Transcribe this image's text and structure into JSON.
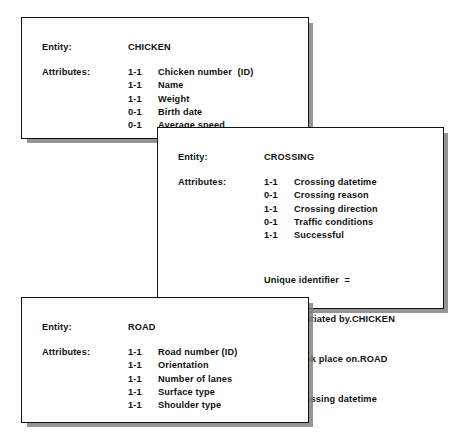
{
  "diagram": {
    "style": {
      "card_background": "#ffffff",
      "card_border": "#111111",
      "card_shadow": "#828282",
      "text_color": "#101010"
    },
    "labels": {
      "entity": "Entity:",
      "attributes": "Attributes:"
    },
    "cards": [
      {
        "id": "chicken",
        "entity_name": "CHICKEN",
        "attributes": [
          {
            "cardinality": "1-1",
            "name": "Chicken number  (ID)"
          },
          {
            "cardinality": "1-1",
            "name": "Name"
          },
          {
            "cardinality": "1-1",
            "name": "Weight"
          },
          {
            "cardinality": "0-1",
            "name": "Birth date"
          },
          {
            "cardinality": "0-1",
            "name": "Average speed"
          }
        ]
      },
      {
        "id": "crossing",
        "entity_name": "CROSSING",
        "attributes": [
          {
            "cardinality": "1-1",
            "name": "Crossing datetime"
          },
          {
            "cardinality": "0-1",
            "name": "Crossing reason"
          },
          {
            "cardinality": "1-1",
            "name": "Crossing direction"
          },
          {
            "cardinality": "0-1",
            "name": "Traffic conditions"
          },
          {
            "cardinality": "1-1",
            "name": "Successful"
          }
        ],
        "unique_identifier": {
          "heading": "Unique identifier  =",
          "lines": [
            "Was initiated by.CHICKEN",
            "+ Took place on.ROAD",
            "+ Crossing datetime"
          ]
        }
      },
      {
        "id": "road",
        "entity_name": "ROAD",
        "attributes": [
          {
            "cardinality": "1-1",
            "name": "Road number (ID)"
          },
          {
            "cardinality": "1-1",
            "name": "Orientation"
          },
          {
            "cardinality": "1-1",
            "name": "Number of lanes"
          },
          {
            "cardinality": "1-1",
            "name": "Surface type"
          },
          {
            "cardinality": "1-1",
            "name": "Shoulder type"
          }
        ]
      }
    ]
  }
}
